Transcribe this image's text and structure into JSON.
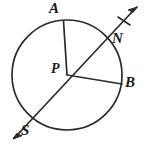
{
  "figure": {
    "kind": "circle-geometry-diagram",
    "stroke_color": "#2b2b2b",
    "background_color": "#ffffff",
    "labels": {
      "center": "P",
      "point_a": "A",
      "point_n": "N",
      "point_b": "B",
      "point_s": "S"
    },
    "geometry": {
      "circle": {
        "cx": 67,
        "cy": 75,
        "r": 55
      },
      "points": {
        "P": {
          "x": 67,
          "y": 75
        },
        "A": {
          "x": 63,
          "y": 21
        },
        "N": {
          "x": 107,
          "y": 36
        },
        "B": {
          "x": 121,
          "y": 84
        },
        "S": {
          "x": 24,
          "y": 128
        }
      },
      "ray_tip": {
        "x": 136,
        "y": 8
      },
      "arrow_tail_tip": {
        "x": 13,
        "y": 137
      },
      "tick_mark": {
        "x": 124,
        "y": 20
      }
    }
  }
}
